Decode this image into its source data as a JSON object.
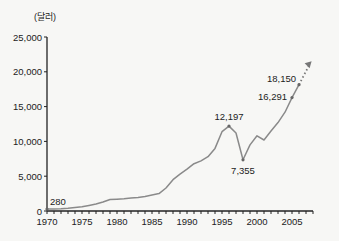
{
  "chart_data": {
    "type": "line",
    "title": "",
    "unit_label": "(달러)",
    "xlabel": "",
    "ylabel": "(달러)",
    "ylim": [
      0,
      25000
    ],
    "xlim": [
      1970,
      2008
    ],
    "grid": false,
    "legend": null,
    "y_ticks": [
      {
        "value": 0,
        "label": "0"
      },
      {
        "value": 5000,
        "label": "5,000"
      },
      {
        "value": 10000,
        "label": "10,000"
      },
      {
        "value": 15000,
        "label": "15,000"
      },
      {
        "value": 20000,
        "label": "20,000"
      },
      {
        "value": 25000,
        "label": "25,000"
      }
    ],
    "x_ticks": [
      {
        "value": 1970,
        "label": "1970"
      },
      {
        "value": 1975,
        "label": "1975"
      },
      {
        "value": 1980,
        "label": "1980"
      },
      {
        "value": 1985,
        "label": "1985"
      },
      {
        "value": 1990,
        "label": "1990"
      },
      {
        "value": 1995,
        "label": "1995"
      },
      {
        "value": 2000,
        "label": "2000"
      },
      {
        "value": 2005,
        "label": "2005"
      }
    ],
    "series": [
      {
        "name": "1인당 국민소득",
        "color": "#8a8a8a",
        "x": [
          1970,
          1971,
          1972,
          1973,
          1974,
          1975,
          1976,
          1977,
          1978,
          1979,
          1980,
          1981,
          1982,
          1983,
          1984,
          1985,
          1986,
          1987,
          1988,
          1989,
          1990,
          1991,
          1992,
          1993,
          1994,
          1995,
          1996,
          1997,
          1998,
          1999,
          2000,
          2001,
          2002,
          2003,
          2004,
          2005,
          2006
        ],
        "values": [
          280,
          300,
          320,
          400,
          520,
          600,
          800,
          1000,
          1300,
          1650,
          1700,
          1750,
          1850,
          1950,
          2100,
          2300,
          2500,
          3300,
          4500,
          5300,
          6000,
          6800,
          7200,
          7800,
          9000,
          11400,
          12197,
          11200,
          7355,
          9500,
          10800,
          10200,
          11500,
          12700,
          14200,
          16291,
          18150
        ]
      }
    ],
    "annotations": [
      {
        "x": 1970,
        "y": 280,
        "label": "280"
      },
      {
        "x": 1996,
        "y": 12197,
        "label": "12,197"
      },
      {
        "x": 1998,
        "y": 7355,
        "label": "7,355"
      },
      {
        "x": 2005,
        "y": 16291,
        "label": "16,291"
      },
      {
        "x": 2006,
        "y": 18150,
        "label": "18,150"
      }
    ],
    "trend_arrow": {
      "from": {
        "x": 2006,
        "y": 18150
      },
      "to": {
        "x": 2007.8,
        "y": 21500
      },
      "style": "dotted"
    }
  }
}
